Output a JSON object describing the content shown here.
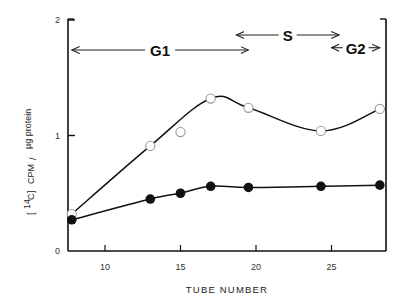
{
  "chart_data": {
    "type": "line",
    "title": "",
    "xlabel": "TUBE NUMBER",
    "ylabel": "[14C] CPM / µg protein",
    "ylabel_parts": {
      "bracket_iso": "14",
      "element": "C",
      "rest": "CPM",
      "slash": "/",
      "unit": "µg protein"
    },
    "xlim": [
      7.6,
      28.2
    ],
    "ylim": [
      0,
      2
    ],
    "x_ticks": [
      10,
      15,
      20,
      25
    ],
    "x_tick_labels": [
      "10",
      "15",
      "20",
      "25"
    ],
    "y_ticks": [
      0,
      1,
      2
    ],
    "y_tick_labels": [
      "0",
      "1",
      "2"
    ],
    "grid": false,
    "series": [
      {
        "name": "open circles",
        "marker": "open-circle",
        "x": [
          7.8,
          13,
          15,
          17,
          19.5,
          24.3,
          28.2
        ],
        "y": [
          0.32,
          0.91,
          1.03,
          1.32,
          1.24,
          1.04,
          1.23
        ]
      },
      {
        "name": "filled circles",
        "marker": "filled-circle",
        "x": [
          7.8,
          13,
          15,
          17,
          19.5,
          24.3,
          28.2
        ],
        "y": [
          0.27,
          0.45,
          0.5,
          0.56,
          0.55,
          0.56,
          0.57
        ]
      }
    ],
    "annotations": [
      {
        "label": "G1",
        "type": "double-arrow",
        "x_start": 7.8,
        "x_end": 19.5,
        "y": 1.74
      },
      {
        "label": "S",
        "type": "double-arrow",
        "x_start": 18.7,
        "x_end": 25.5,
        "y": 1.87
      },
      {
        "label": "G2",
        "type": "double-arrow",
        "x_start": 25.0,
        "x_end": 28.2,
        "y": 1.76
      }
    ]
  },
  "labels": {
    "xlabel": "TUBE NUMBER",
    "phase_g1": "G1",
    "phase_s": "S",
    "phase_g2": "G2",
    "y_iso": "14",
    "y_element": "C",
    "y_cpm": "CPM",
    "y_slash": "/",
    "y_unit": "µg protein"
  }
}
